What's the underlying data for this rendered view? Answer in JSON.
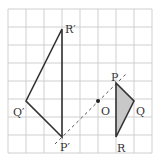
{
  "grid": {
    "x0": 8,
    "y0": 9,
    "cell": 18,
    "cols": 8,
    "rows": 8,
    "color": "#cfcfcf"
  },
  "points": {
    "P": [
      116,
      83
    ],
    "Q": [
      134,
      101
    ],
    "R": [
      116,
      137
    ],
    "P_prime": [
      62,
      137
    ],
    "Q_prime": [
      26,
      101
    ],
    "R_prime": [
      62,
      29
    ],
    "O": [
      98,
      101
    ]
  },
  "labels": {
    "P": "P",
    "Q": "Q",
    "R": "R",
    "P_prime": "P′",
    "Q_prime": "Q′",
    "R_prime": "R′",
    "O": "O"
  },
  "colors": {
    "line": "#333333",
    "fill": "#c8c8c8",
    "dash": "#555555"
  }
}
